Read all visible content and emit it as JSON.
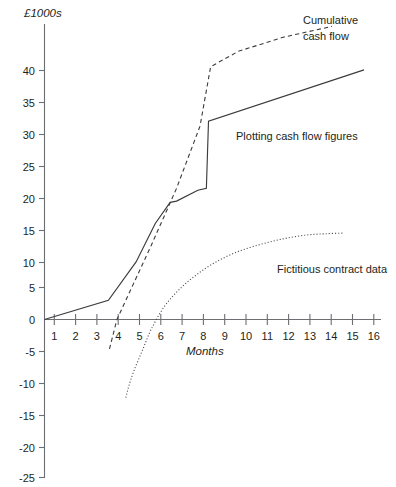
{
  "chart_data": {
    "type": "line",
    "title": "",
    "ylabel": "£1000s",
    "xlabel": "Months",
    "xlim": [
      0,
      16
    ],
    "ylim": [
      -25,
      45
    ],
    "grid": false,
    "legend_position": "inline-annotations",
    "x_ticks": [
      "1",
      "2",
      "3",
      "4",
      "5",
      "6",
      "7",
      "8",
      "9",
      "10",
      "11",
      "12",
      "13",
      "14",
      "15",
      "16"
    ],
    "x_tick_values": [
      1,
      2,
      3,
      4,
      5,
      6,
      7,
      8,
      9,
      10,
      11,
      12,
      13,
      14,
      15,
      16
    ],
    "y_ticks": [
      "40",
      "35",
      "30",
      "25",
      "20",
      "15",
      "10",
      "5",
      "0",
      "-5",
      "-10",
      "-15",
      "-20",
      "-25"
    ],
    "y_tick_values": [
      40,
      35,
      30,
      25,
      20,
      15,
      10,
      5,
      0,
      -5,
      -10,
      -15,
      -20,
      -25
    ],
    "series": [
      {
        "name": "Plotting cash flow figures",
        "style": "solid",
        "x": [
          0,
          3,
          4.3,
          5.2,
          5.9,
          6.2,
          7.2,
          7.6,
          7.7,
          15
        ],
        "values": [
          0,
          3,
          9,
          15,
          18.3,
          18.5,
          20.2,
          20.5,
          31,
          39
        ]
      },
      {
        "name": "Cumulative cash flow",
        "style": "dashed",
        "x": [
          3.05,
          3.4,
          5,
          6.2,
          7.3,
          7.8,
          9.1,
          11.2,
          13.5
        ],
        "values": [
          -4.6,
          0,
          11.5,
          20.5,
          30.2,
          39.5,
          41.9,
          44.1,
          45.8
        ]
      },
      {
        "name": "Fictitious contract data",
        "style": "dotted",
        "x": [
          3.82,
          3.95,
          4.2,
          4.6,
          5.0,
          5.6,
          6.3,
          7.1,
          8.0,
          9.0,
          10.1,
          11.2,
          12.3,
          13.2,
          14.0
        ],
        "values": [
          -12.2,
          -10.5,
          -8.0,
          -4.8,
          -1.6,
          1.9,
          4.6,
          6.9,
          8.9,
          10.5,
          11.7,
          12.6,
          13.2,
          13.4,
          13.5
        ]
      }
    ],
    "annotations": [
      {
        "id": "cumulative",
        "line1": "Cumulative",
        "line2": "cash flow"
      },
      {
        "id": "plotting",
        "line1": "Plotting cash flow figures",
        "line2": ""
      },
      {
        "id": "fictitious",
        "line1": "Fictitious contract data",
        "line2": ""
      }
    ]
  }
}
